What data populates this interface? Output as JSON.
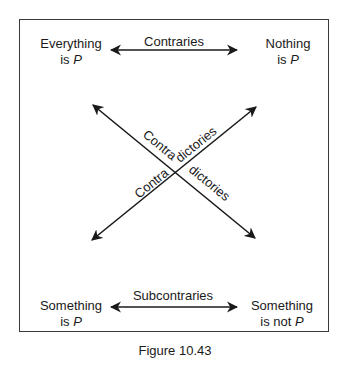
{
  "figure": {
    "caption": "Figure 10.43",
    "corners": {
      "top_left": {
        "line1": "Everything",
        "line2_prefix": "is ",
        "line2_var": "P"
      },
      "top_right": {
        "line1": "Nothing",
        "line2_prefix": "is ",
        "line2_var": "P"
      },
      "bottom_left": {
        "line1": "Something",
        "line2_prefix": "is ",
        "line2_var": "P"
      },
      "bottom_right": {
        "line1": "Something",
        "line2_prefix": "is not ",
        "line2_var": "P"
      }
    },
    "relations": {
      "top": "Contraries",
      "bottom": "Subcontraries",
      "diagonal_a_part1": "Contra",
      "diagonal_a_part2": "dictories",
      "diagonal_b_part1": "Contra",
      "diagonal_b_part2": "dictories"
    },
    "colors": {
      "ink": "#1a1a1a",
      "frame": "#3a3a3a",
      "background": "#ffffff"
    }
  }
}
